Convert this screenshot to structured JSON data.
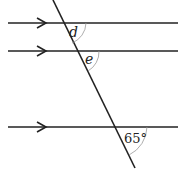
{
  "diagram": {
    "parallel_lines": [
      {
        "id": "line-1",
        "y": 23,
        "x1": 8,
        "x2": 178,
        "arrow_x": 40
      },
      {
        "id": "line-2",
        "y": 51,
        "x1": 8,
        "x2": 178,
        "arrow_x": 40
      },
      {
        "id": "line-3",
        "y": 127,
        "x1": 8,
        "x2": 178,
        "arrow_x": 40
      }
    ],
    "transversal": {
      "x1": 53,
      "y1": 0,
      "x2": 135,
      "y2": 168
    },
    "angles": {
      "d": {
        "label": "d",
        "x": 73,
        "y": 36
      },
      "e": {
        "label": "e",
        "x": 86,
        "y": 64
      },
      "given": {
        "label": "65°",
        "x": 124,
        "y": 142
      }
    },
    "colors": {
      "line": "#222222",
      "arc": "#999999"
    }
  }
}
